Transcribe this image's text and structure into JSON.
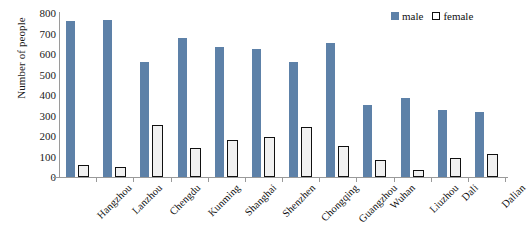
{
  "chart_data": {
    "type": "bar",
    "title": "",
    "xlabel": "",
    "ylabel": "Number of people",
    "ylim": [
      0,
      800
    ],
    "yticks": [
      0,
      100,
      200,
      300,
      400,
      500,
      600,
      700,
      800
    ],
    "grid": false,
    "legend_position": "top-right",
    "categories": [
      "Hangzhou",
      "Lanzhou",
      "Chengdu",
      "Kunming",
      "Shanghai",
      "Shenzhen",
      "Chongqing",
      "Guangzhou",
      "Wuhan",
      "Liuzhou",
      "Dali",
      "Dalian"
    ],
    "series": [
      {
        "name": "male",
        "color": "#5d81a8",
        "values": [
          760,
          765,
          560,
          680,
          635,
          625,
          560,
          655,
          350,
          385,
          325,
          315
        ]
      },
      {
        "name": "female",
        "color": "#ffffff",
        "values": [
          60,
          50,
          255,
          140,
          180,
          195,
          245,
          150,
          85,
          35,
          95,
          110
        ]
      }
    ]
  },
  "legend": {
    "items": [
      {
        "label": "male",
        "swatch": "filled-square-icon"
      },
      {
        "label": "female",
        "swatch": "outlined-square-icon"
      }
    ]
  },
  "axes": {
    "y_title": "Number of people"
  }
}
